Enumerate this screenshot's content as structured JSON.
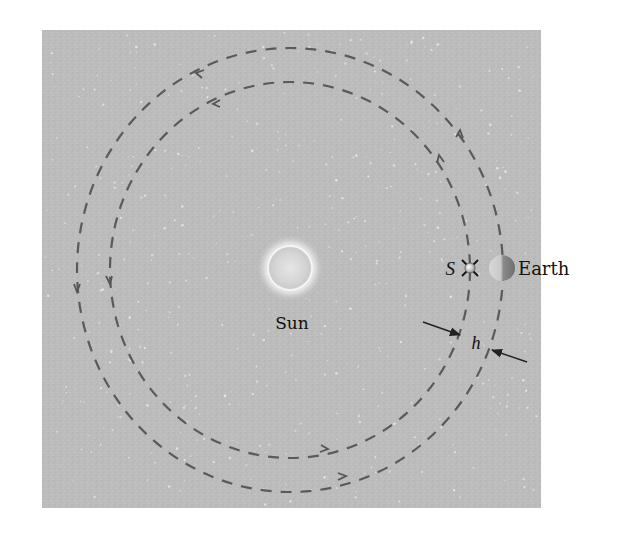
{
  "figure": {
    "type": "orbit-diagram",
    "panel": {
      "x": 42,
      "y": 30,
      "width": 499,
      "height": 478,
      "background": "#bcbcbc",
      "star_color": "#e8e8e8"
    },
    "orbits": [
      {
        "name": "satellite-orbit-outer",
        "cx": 290,
        "cy": 270,
        "rx": 213,
        "ry": 222,
        "stroke": "#555555",
        "direction": "counterclockwise"
      },
      {
        "name": "earth-orbit-inner",
        "cx": 290,
        "cy": 270,
        "rx": 180,
        "ry": 188,
        "stroke": "#555555",
        "direction": "counterclockwise"
      }
    ],
    "sun": {
      "label": "Sun",
      "cx": 290,
      "cy": 268,
      "r": 22
    },
    "satellite": {
      "label": "S",
      "cx": 470,
      "cy": 268
    },
    "earth": {
      "label": "Earth",
      "cx": 502,
      "cy": 268,
      "r": 13
    },
    "separation": {
      "label": "h"
    }
  }
}
